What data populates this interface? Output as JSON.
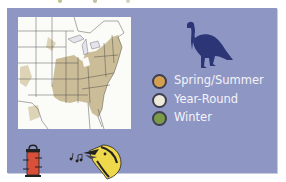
{
  "legend": {
    "items": [
      {
        "label": "Spring/Summer",
        "color": "#d4a050"
      },
      {
        "label": "Year-Round",
        "color": "#ecead8"
      },
      {
        "label": "Winter",
        "color": "#7a9a48"
      }
    ]
  },
  "colors": {
    "panel_background": "#8e96c4",
    "range_fill": "#cbbd97",
    "turkey": "#2c3676",
    "feeder": "#d9503a"
  },
  "icons": {
    "turkey": "turkey-silhouette-icon",
    "feeder": "bird-feeder-icon",
    "singing_bird": "singing-bird-icon"
  }
}
